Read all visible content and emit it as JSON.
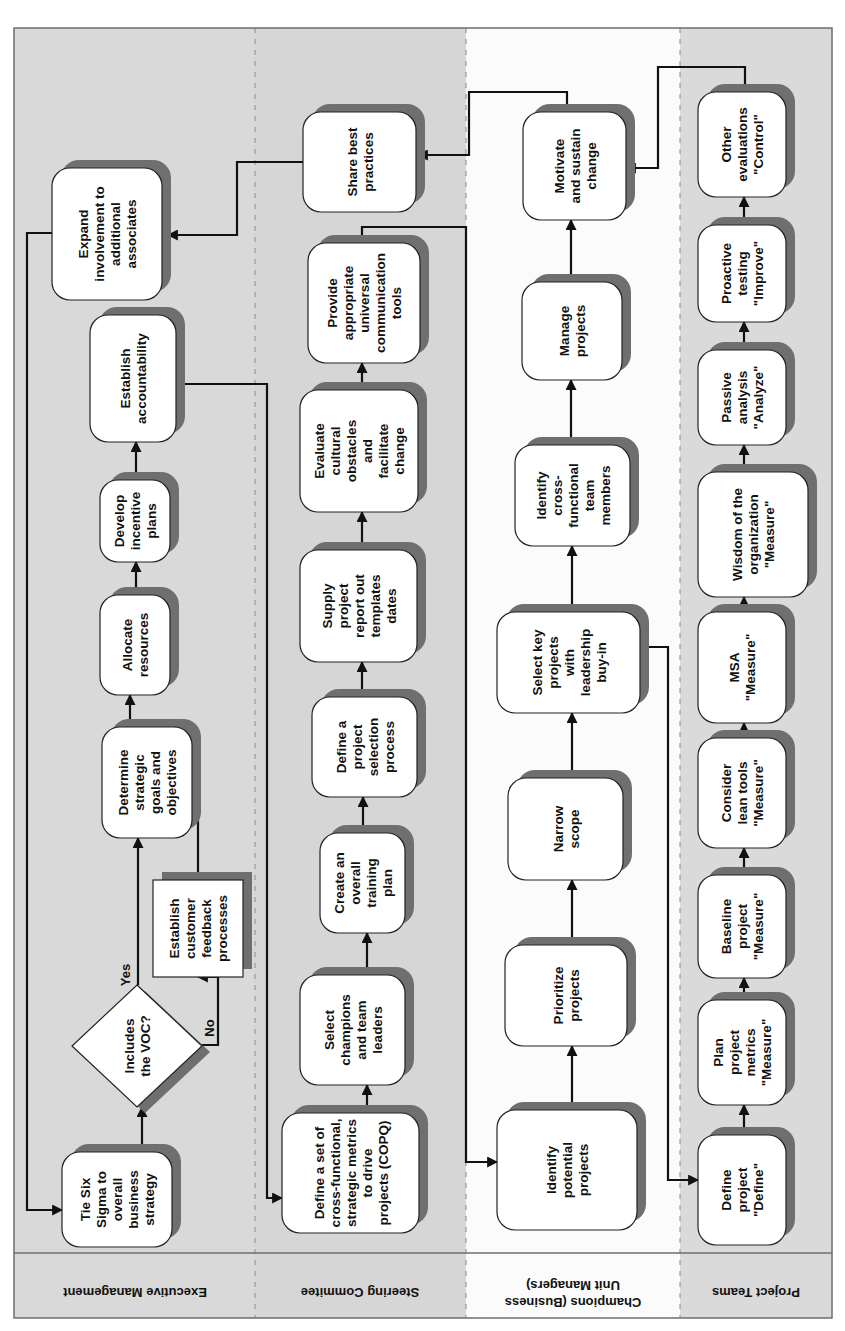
{
  "lanes": [
    {
      "id": "exec",
      "label": "Executive Management"
    },
    {
      "id": "steer",
      "label": "Steering Commitee"
    },
    {
      "id": "champ",
      "label": "Champions (Business Unit Managers)",
      "lines": [
        "Champions (Business",
        "Unit Managers)"
      ]
    },
    {
      "id": "team",
      "label": "Project Teams"
    }
  ],
  "nodes": {
    "tie_six_sigma": {
      "lane": "exec",
      "lines": [
        "Tie Six",
        "Sigma to",
        "overall",
        "business",
        "strategy"
      ]
    },
    "includes_voc": {
      "lane": "exec",
      "shape": "decision",
      "lines": [
        "Includes",
        "the VOC?"
      ]
    },
    "establish_feedback": {
      "lane": "exec",
      "shape": "rect",
      "lines": [
        "Establish",
        "customer",
        "feedback",
        "processes"
      ]
    },
    "determine_goals": {
      "lane": "exec",
      "lines": [
        "Determine",
        "strategic",
        "goals and",
        "objectives"
      ]
    },
    "allocate_resources": {
      "lane": "exec",
      "lines": [
        "Allocate",
        "resources"
      ]
    },
    "develop_incentive": {
      "lane": "exec",
      "lines": [
        "Develop",
        "incentive",
        "plans"
      ]
    },
    "establish_accountability": {
      "lane": "exec",
      "lines": [
        "Establish",
        "accountability"
      ]
    },
    "expand_involvement": {
      "lane": "exec",
      "lines": [
        "Expand",
        "involvement to",
        "additional",
        "associates"
      ]
    },
    "define_metrics": {
      "lane": "steer",
      "lines": [
        "Define a set of",
        "cross-functional,",
        "strategic metrics",
        "to drive",
        "projects (COPQ)"
      ]
    },
    "select_champions": {
      "lane": "steer",
      "lines": [
        "Select",
        "champions",
        "and team",
        "leaders"
      ]
    },
    "training_plan": {
      "lane": "steer",
      "lines": [
        "Create an",
        "overall",
        "training",
        "plan"
      ]
    },
    "selection_process": {
      "lane": "steer",
      "lines": [
        "Define a",
        "project",
        "selection",
        "process"
      ]
    },
    "supply_templates": {
      "lane": "steer",
      "lines": [
        "Supply",
        "project",
        "report out",
        "templates",
        "dates"
      ]
    },
    "evaluate_cultural": {
      "lane": "steer",
      "lines": [
        "Evaluate",
        "cultural",
        "obstacles",
        "and",
        "facilitate",
        "change"
      ]
    },
    "communication_tools": {
      "lane": "steer",
      "lines": [
        "Provide",
        "appropriate",
        "universal",
        "communication",
        "tools"
      ]
    },
    "share_practices": {
      "lane": "steer",
      "lines": [
        "Share best",
        "practices"
      ]
    },
    "identify_potential": {
      "lane": "champ",
      "lines": [
        "Identify",
        "potential",
        "projects"
      ]
    },
    "prioritize": {
      "lane": "champ",
      "lines": [
        "Prioritize",
        "projects"
      ]
    },
    "narrow_scope": {
      "lane": "champ",
      "lines": [
        "Narrow",
        "scope"
      ]
    },
    "select_key": {
      "lane": "champ",
      "lines": [
        "Select key",
        "projects",
        "with",
        "leadership",
        "buy-in"
      ]
    },
    "identify_team": {
      "lane": "champ",
      "lines": [
        "Identify",
        "cross-",
        "functional",
        "team",
        "members"
      ]
    },
    "manage_projects": {
      "lane": "champ",
      "lines": [
        "Manage",
        "projects"
      ]
    },
    "motivate_sustain": {
      "lane": "champ",
      "lines": [
        "Motivate",
        "and sustain",
        "change"
      ]
    },
    "define_project": {
      "lane": "team",
      "lines": [
        "Define",
        "project",
        "\"Define\""
      ]
    },
    "plan_metrics": {
      "lane": "team",
      "lines": [
        "Plan",
        "project",
        "metrics",
        "\"Measure\""
      ]
    },
    "baseline": {
      "lane": "team",
      "lines": [
        "Baseline",
        "project",
        "\"Measure\""
      ]
    },
    "lean_tools": {
      "lane": "team",
      "lines": [
        "Consider",
        "lean tools",
        "\"Measure\""
      ]
    },
    "msa": {
      "lane": "team",
      "lines": [
        "MSA",
        "\"Measure\""
      ]
    },
    "wisdom": {
      "lane": "team",
      "lines": [
        "Wisdom of the",
        "organization",
        "\"Measure\""
      ]
    },
    "passive_analysis": {
      "lane": "team",
      "lines": [
        "Passive",
        "analysis",
        "\"Analyze\""
      ]
    },
    "proactive_testing": {
      "lane": "team",
      "lines": [
        "Proactive",
        "testing",
        "\"Improve\""
      ]
    },
    "other_evaluations": {
      "lane": "team",
      "lines": [
        "Other",
        "evaluations",
        "\"Control\""
      ]
    }
  },
  "edge_labels": {
    "yes": "Yes",
    "no": "No"
  },
  "colors": {
    "lane_exec": "#d9d9d9",
    "lane_steer": "#d6d6d6",
    "lane_champ": "#fbfbfb",
    "lane_team": "#dadada",
    "node_fill": "#ffffff",
    "node_shadow": "#6f6f6f",
    "edge": "#111111"
  }
}
